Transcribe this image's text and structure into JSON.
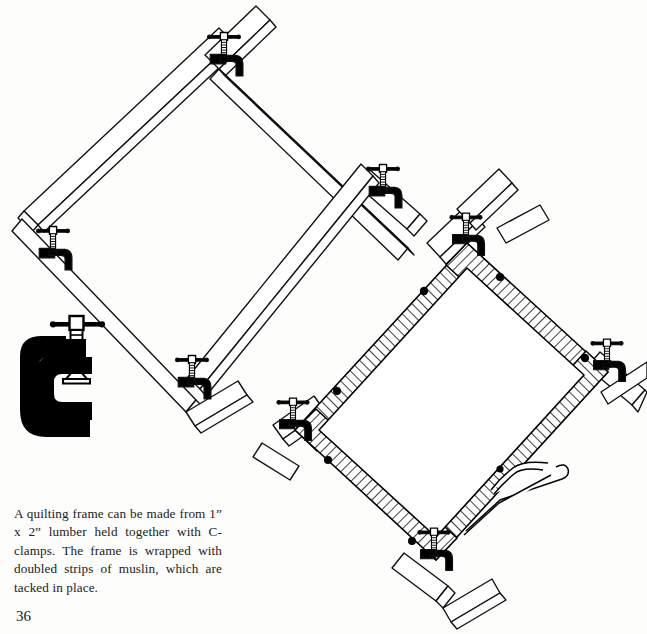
{
  "page": {
    "number": "36",
    "background_color": "#fdfdfc",
    "ink_color": "#000000"
  },
  "caption": {
    "text": "A quilting frame can be made from 1” x 2” lumber held together with C-clamps. The frame is wrapped with doubled strips of muslin, which are tacked in place."
  },
  "illustrations": [
    {
      "name": "plain-quilting-frame",
      "description": "Diamond-oriented square frame of 1 x 2 lumber, four boards overlapping at the corners, joined with four small C-clamps",
      "clamp_count": 4,
      "board_count": 4,
      "wrapped": false
    },
    {
      "name": "muslin-wrapped-quilting-frame",
      "description": "Same diamond frame with each rail wrapped in doubled strips of muslin shown as diagonal hatching, tacks shown as black dots, loose strip end trailing at lower right",
      "clamp_count": 4,
      "board_count": 4,
      "wrapped": true,
      "tack_count": 7
    },
    {
      "name": "c-clamp-detail",
      "description": "Large solid-black C-clamp with threaded screw and T-handle, shown as a detail",
      "parts": [
        "c-body",
        "threaded-screw",
        "t-handle",
        "swivel-pad"
      ]
    }
  ]
}
